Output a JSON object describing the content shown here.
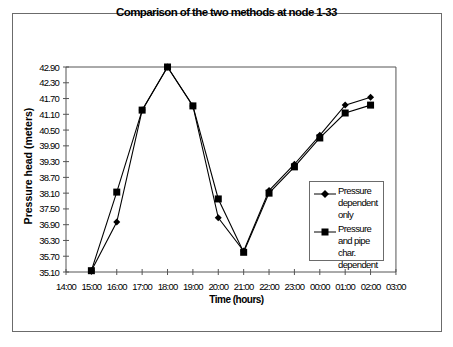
{
  "chart_data": {
    "type": "line",
    "title": "Comparison of the two methods at node 1-33",
    "xlabel": "Time (hours)",
    "ylabel": "Pressure head (meters)",
    "x_ticks": [
      "14:00",
      "15:00",
      "16:00",
      "17:00",
      "18:00",
      "19:00",
      "20:00",
      "21:00",
      "22:00",
      "23:00",
      "00:00",
      "01:00",
      "02:00",
      "03:00"
    ],
    "y_ticks": [
      "35.10",
      "35.70",
      "36.30",
      "36.90",
      "37.50",
      "38.10",
      "38.70",
      "39.30",
      "39.90",
      "40.50",
      "41.10",
      "41.70",
      "42.30",
      "42.90"
    ],
    "ylim": [
      35.1,
      42.9
    ],
    "x": [
      "15:00",
      "16:00",
      "17:00",
      "18:00",
      "19:00",
      "20:00",
      "21:00",
      "22:00",
      "23:00",
      "00:00",
      "01:00",
      "02:00"
    ],
    "series": [
      {
        "name": "Pressure dependent only",
        "marker": "diamond",
        "values": [
          35.15,
          37.0,
          41.26,
          42.9,
          41.42,
          37.16,
          35.9,
          38.2,
          39.2,
          40.3,
          41.45,
          41.75
        ]
      },
      {
        "name": "Pressure and pipe char. dependent",
        "marker": "square",
        "values": [
          35.15,
          38.14,
          41.26,
          42.9,
          41.42,
          37.88,
          35.85,
          38.1,
          39.1,
          40.2,
          41.15,
          41.45
        ]
      }
    ],
    "grid": false,
    "legend_position": "right-inside"
  },
  "legend": {
    "item1_label": "Pressure dependent only",
    "item2_label": "Pressure and pipe char. dependent"
  },
  "colors": {
    "line": "#000000",
    "axis": "#555555",
    "frame": "#6b6b6b"
  }
}
